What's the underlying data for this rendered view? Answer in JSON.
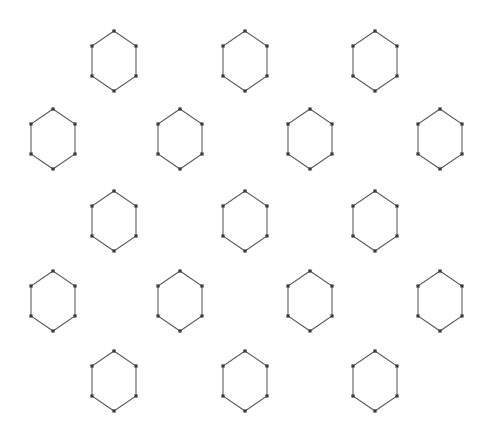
{
  "figure": {
    "canvas": {
      "width": 494,
      "height": 434
    },
    "background_color": "#ffffff"
  },
  "style": {
    "edge_color": "#5a5a5e",
    "edge_width": 1.05,
    "vertex_color": "#3a3a3e",
    "vertex_shape": "square",
    "vertex_size": 3.2
  },
  "chart_data": {
    "type": "scatter",
    "xlabel": "",
    "ylabel": "",
    "xlim": [
      0,
      494
    ],
    "ylim": [
      0,
      434
    ],
    "grid": false,
    "legend": "none",
    "lattice": {
      "rows": 5,
      "hexagon_count": 17,
      "row_counts": [
        3,
        4,
        3,
        4,
        3
      ],
      "hex_width": 44,
      "hex_height": 60,
      "horizontal_pitch": 130,
      "vertical_pitch": 80,
      "row_offset_odd": 114,
      "row_offset_even": 53,
      "vertex_offsets": [
        {
          "dx": 0,
          "dy": -30
        },
        {
          "dx": 22,
          "dy": -15
        },
        {
          "dx": 22,
          "dy": 15
        },
        {
          "dx": 0,
          "dy": 30
        },
        {
          "dx": -22,
          "dy": 15
        },
        {
          "dx": -22,
          "dy": -15
        }
      ]
    },
    "hexagons": [
      {
        "id": "r1c1",
        "row": 1,
        "col": 1,
        "cx": 114,
        "cy": 61
      },
      {
        "id": "r1c2",
        "row": 1,
        "col": 2,
        "cx": 245,
        "cy": 61
      },
      {
        "id": "r1c3",
        "row": 1,
        "col": 3,
        "cx": 375,
        "cy": 61
      },
      {
        "id": "r2c1",
        "row": 2,
        "col": 1,
        "cx": 53,
        "cy": 139
      },
      {
        "id": "r2c2",
        "row": 2,
        "col": 2,
        "cx": 180,
        "cy": 139
      },
      {
        "id": "r2c3",
        "row": 2,
        "col": 3,
        "cx": 310,
        "cy": 139
      },
      {
        "id": "r2c4",
        "row": 2,
        "col": 4,
        "cx": 440,
        "cy": 139
      },
      {
        "id": "r3c1",
        "row": 3,
        "col": 1,
        "cx": 114,
        "cy": 221
      },
      {
        "id": "r3c2",
        "row": 3,
        "col": 2,
        "cx": 245,
        "cy": 221
      },
      {
        "id": "r3c3",
        "row": 3,
        "col": 3,
        "cx": 375,
        "cy": 221
      },
      {
        "id": "r4c1",
        "row": 4,
        "col": 1,
        "cx": 53,
        "cy": 301
      },
      {
        "id": "r4c2",
        "row": 4,
        "col": 2,
        "cx": 180,
        "cy": 301
      },
      {
        "id": "r4c3",
        "row": 4,
        "col": 3,
        "cx": 310,
        "cy": 301
      },
      {
        "id": "r4c4",
        "row": 4,
        "col": 4,
        "cx": 440,
        "cy": 301
      },
      {
        "id": "r5c1",
        "row": 5,
        "col": 1,
        "cx": 114,
        "cy": 381
      },
      {
        "id": "r5c2",
        "row": 5,
        "col": 2,
        "cx": 245,
        "cy": 381
      },
      {
        "id": "r5c3",
        "row": 5,
        "col": 3,
        "cx": 375,
        "cy": 381
      }
    ]
  }
}
